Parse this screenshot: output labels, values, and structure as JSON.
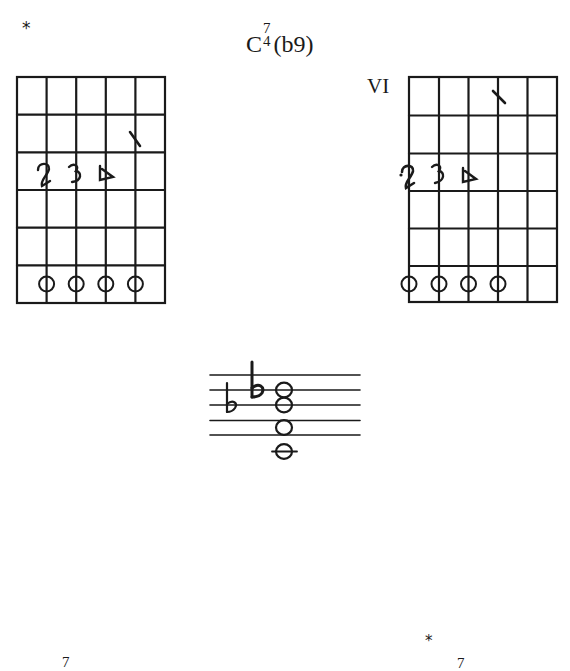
{
  "page": {
    "top_marker": "*",
    "title": {
      "root": "C",
      "superscript": "7",
      "subscript": "4",
      "extension": "(b9)"
    }
  },
  "diagrams": [
    {
      "id": "left",
      "position_label": "",
      "strings": 6,
      "frets": 6,
      "finger_numbers": [
        {
          "label": "2",
          "string": 2,
          "fret": 3
        },
        {
          "label": "3",
          "string": 3,
          "fret": 3
        },
        {
          "label": "4",
          "string": 4,
          "fret": 3
        },
        {
          "label": "1",
          "string": 5,
          "fret": 2,
          "style": "slash"
        }
      ],
      "note_circles": [
        {
          "string": 2,
          "fret": 6
        },
        {
          "string": 3,
          "fret": 6
        },
        {
          "string": 4,
          "fret": 6
        },
        {
          "string": 5,
          "fret": 6
        }
      ]
    },
    {
      "id": "right",
      "position_label": "VI",
      "strings": 6,
      "frets": 6,
      "finger_numbers": [
        {
          "label": "2",
          "string": 1,
          "fret": 3
        },
        {
          "label": "3",
          "string": 2,
          "fret": 3
        },
        {
          "label": "4",
          "string": 3,
          "fret": 3
        },
        {
          "label": "1",
          "string": 4,
          "fret": 1,
          "style": "slash"
        }
      ],
      "note_circles": [
        {
          "string": 1,
          "fret": 6
        },
        {
          "string": 2,
          "fret": 6
        },
        {
          "string": 3,
          "fret": 6
        },
        {
          "string": 4,
          "fret": 6
        }
      ]
    }
  ],
  "staff": {
    "lines": 5,
    "accidentals": [
      {
        "symbol": "flat",
        "position": "line-3",
        "size": "small"
      },
      {
        "symbol": "flat",
        "position": "line-2",
        "size": "large"
      }
    ],
    "chord_notes": [
      {
        "position": "line-2"
      },
      {
        "position": "line-3"
      },
      {
        "position": "space-4"
      },
      {
        "position": "ledger-below-1"
      }
    ]
  },
  "footer_fragments": {
    "left_superscript": "7",
    "right_marker": "*",
    "right_superscript": "7"
  }
}
